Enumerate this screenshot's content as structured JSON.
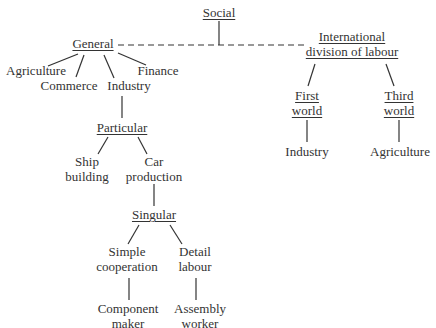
{
  "diagram": {
    "type": "hierarchy-tree",
    "colors": {
      "text": "#333333",
      "line": "#333333",
      "background": "#ffffff"
    },
    "nodes": {
      "social": {
        "lines": [
          "Social"
        ],
        "underlined": true
      },
      "general": {
        "lines": [
          "General"
        ],
        "underlined": true
      },
      "agriculture": {
        "lines": [
          "Agriculture"
        ]
      },
      "commerce": {
        "lines": [
          "Commerce"
        ]
      },
      "industry": {
        "lines": [
          "Industry"
        ]
      },
      "finance": {
        "lines": [
          "Finance"
        ]
      },
      "particular": {
        "lines": [
          "Particular"
        ],
        "underlined": true
      },
      "ship_building": {
        "lines": [
          "Ship",
          "building"
        ]
      },
      "car_production": {
        "lines": [
          "Car",
          "production"
        ]
      },
      "singular": {
        "lines": [
          "Singular"
        ],
        "underlined": true
      },
      "simple_cooperation": {
        "lines": [
          "Simple",
          "cooperation"
        ]
      },
      "detail_labour": {
        "lines": [
          "Detail",
          "labour"
        ]
      },
      "component_maker": {
        "lines": [
          "Component",
          "maker"
        ]
      },
      "assembly_worker": {
        "lines": [
          "Assembly",
          "worker"
        ]
      },
      "international_division": {
        "lines": [
          "International",
          "division of labour"
        ],
        "underlined": true
      },
      "first_world": {
        "lines": [
          "First",
          "world"
        ],
        "underlined": true
      },
      "third_world": {
        "lines": [
          "Third",
          "world"
        ],
        "underlined": true
      },
      "first_world_industry": {
        "lines": [
          "Industry"
        ]
      },
      "third_world_agriculture": {
        "lines": [
          "Agriculture"
        ]
      }
    },
    "edges": [
      {
        "from": "social",
        "to": "general",
        "style": "dashed"
      },
      {
        "from": "social",
        "to": "international_division",
        "style": "dashed"
      },
      {
        "from": "general",
        "to": "agriculture",
        "style": "solid"
      },
      {
        "from": "general",
        "to": "commerce",
        "style": "solid"
      },
      {
        "from": "general",
        "to": "industry",
        "style": "solid"
      },
      {
        "from": "general",
        "to": "finance",
        "style": "solid"
      },
      {
        "from": "industry",
        "to": "particular",
        "style": "solid"
      },
      {
        "from": "particular",
        "to": "ship_building",
        "style": "solid"
      },
      {
        "from": "particular",
        "to": "car_production",
        "style": "solid"
      },
      {
        "from": "car_production",
        "to": "singular",
        "style": "solid"
      },
      {
        "from": "singular",
        "to": "simple_cooperation",
        "style": "solid"
      },
      {
        "from": "singular",
        "to": "detail_labour",
        "style": "solid"
      },
      {
        "from": "simple_cooperation",
        "to": "component_maker",
        "style": "solid"
      },
      {
        "from": "detail_labour",
        "to": "assembly_worker",
        "style": "solid"
      },
      {
        "from": "international_division",
        "to": "first_world",
        "style": "solid"
      },
      {
        "from": "international_division",
        "to": "third_world",
        "style": "solid"
      },
      {
        "from": "first_world",
        "to": "first_world_industry",
        "style": "solid"
      },
      {
        "from": "third_world",
        "to": "third_world_agriculture",
        "style": "solid"
      }
    ]
  }
}
